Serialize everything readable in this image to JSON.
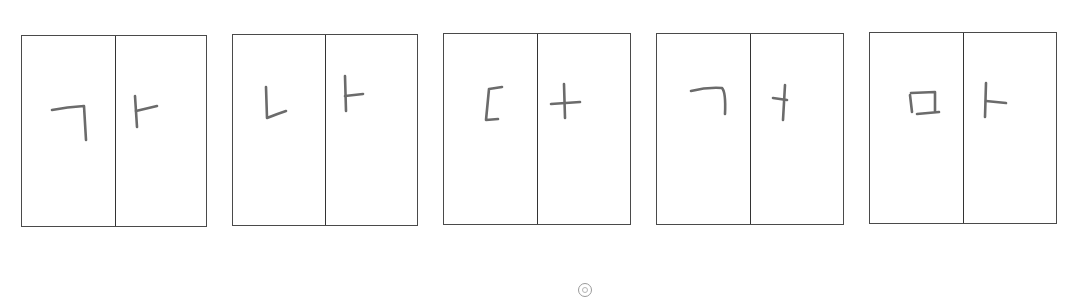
{
  "cards": [
    {
      "left": 21,
      "top": 35,
      "width": 186,
      "height": 192,
      "split": 93,
      "consonant": "ㄱ",
      "vowel": "ㅏ",
      "syllable": "가"
    },
    {
      "left": 232,
      "top": 34,
      "width": 186,
      "height": 192,
      "split": 92,
      "consonant": "ㄴ",
      "vowel": "ㅏ",
      "syllable": "나"
    },
    {
      "left": 443,
      "top": 33,
      "width": 188,
      "height": 192,
      "split": 93,
      "consonant": "ㄷ",
      "vowel": "ㅓ",
      "syllable": "더"
    },
    {
      "left": 656,
      "top": 33,
      "width": 188,
      "height": 192,
      "split": 93,
      "consonant": "ㄱ",
      "vowel": "ㅓ",
      "syllable": "거"
    },
    {
      "left": 869,
      "top": 32,
      "width": 188,
      "height": 192,
      "split": 93,
      "consonant": "ㅁ",
      "vowel": "ㅏ",
      "syllable": "마"
    }
  ],
  "marker": {
    "icon": "circle-marker-icon"
  }
}
